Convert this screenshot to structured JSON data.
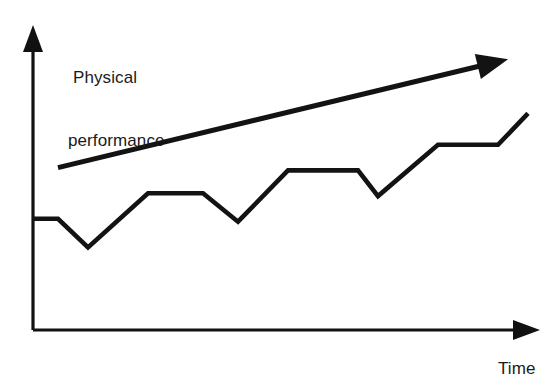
{
  "chart_data": {
    "type": "line",
    "title": "",
    "subtitle": "",
    "xlabel": "Time",
    "ylabel": "Physical performance",
    "ylabel_lines": [
      "Physical",
      "performance"
    ],
    "grid": false,
    "legend": "none",
    "axes": {
      "x": {
        "label": "Time",
        "tick_labels": [],
        "arrow": true,
        "direction": "right",
        "range_note": "unscaled qualitative axis"
      },
      "y": {
        "label": "Physical performance",
        "tick_labels": [],
        "arrow": true,
        "direction": "up",
        "range_note": "unscaled qualitative axis"
      }
    },
    "series": [
      {
        "name": "Physical performance (actual)",
        "style": "stepped-zigzag",
        "color": "#131313",
        "points": [
          {
            "x": 0,
            "y": 39
          },
          {
            "x": 5,
            "y": 39
          },
          {
            "x": 11,
            "y": 29
          },
          {
            "x": 23,
            "y": 48
          },
          {
            "x": 34,
            "y": 48
          },
          {
            "x": 41,
            "y": 38
          },
          {
            "x": 51,
            "y": 56
          },
          {
            "x": 65,
            "y": 56
          },
          {
            "x": 69,
            "y": 47
          },
          {
            "x": 81,
            "y": 65
          },
          {
            "x": 93,
            "y": 65
          },
          {
            "x": 99,
            "y": 76
          }
        ]
      },
      {
        "name": "Long-term trend",
        "style": "straight-arrow",
        "color": "#131313",
        "points": [
          {
            "x": 5,
            "y": 57
          },
          {
            "x": 95,
            "y": 95
          }
        ]
      }
    ],
    "annotations": [
      {
        "name": "trend-arrowhead",
        "text": "",
        "at": {
          "x": 95,
          "y": 95
        }
      },
      {
        "name": "x-axis-arrowhead",
        "text": "",
        "at": {
          "x": 100,
          "y": 0
        }
      },
      {
        "name": "y-axis-arrowhead",
        "text": "",
        "at": {
          "x": 0,
          "y": 100
        }
      }
    ]
  },
  "labels": {
    "y_axis_line_1": "Physical",
    "y_axis_line_2": "performance",
    "x_axis": "Time"
  },
  "colors": {
    "ink": "#131313",
    "axis": "#111111",
    "background": "#ffffff"
  }
}
